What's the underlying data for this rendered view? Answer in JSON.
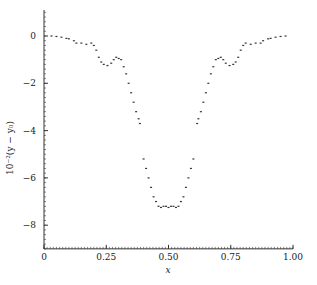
{
  "chart_data": {
    "type": "scatter",
    "title": "",
    "xlabel": "x",
    "ylabel": "10⁻²(y − y₀)",
    "xlim": [
      0,
      1.0
    ],
    "ylim": [
      -9.0,
      1.1
    ],
    "grid": false,
    "legend": null,
    "x_ticks": [
      0,
      0.25,
      0.5,
      0.75,
      1.0
    ],
    "x_tick_labels": [
      "0",
      "0.25",
      "0.50",
      "0.75",
      "1.00"
    ],
    "y_ticks": [
      0,
      -2,
      -4,
      -6,
      -8
    ],
    "y_tick_labels": [
      "0",
      "−2",
      "−4",
      "−6",
      "−8"
    ],
    "series": [
      {
        "name": "data",
        "style": "dotted",
        "x": [
          0.03,
          0.05,
          0.07,
          0.09,
          0.1,
          0.12,
          0.13,
          0.15,
          0.17,
          0.19,
          0.2,
          0.21,
          0.22,
          0.23,
          0.24,
          0.255,
          0.27,
          0.28,
          0.29,
          0.3,
          0.31,
          0.32,
          0.33,
          0.34,
          0.35,
          0.36,
          0.37,
          0.38,
          0.385,
          0.4,
          0.41,
          0.42,
          0.43,
          0.44,
          0.45,
          0.46,
          0.47,
          0.48,
          0.49,
          0.5,
          0.51,
          0.52,
          0.53,
          0.54,
          0.55,
          0.56,
          0.57,
          0.58,
          0.59,
          0.6,
          0.615,
          0.62,
          0.63,
          0.64,
          0.65,
          0.66,
          0.67,
          0.68,
          0.69,
          0.7,
          0.71,
          0.72,
          0.73,
          0.745,
          0.76,
          0.77,
          0.78,
          0.79,
          0.8,
          0.81,
          0.83,
          0.85,
          0.87,
          0.88,
          0.9,
          0.91,
          0.93,
          0.95,
          0.97
        ],
        "y": [
          0.0,
          -0.02,
          -0.05,
          -0.1,
          -0.12,
          -0.2,
          -0.3,
          -0.3,
          -0.35,
          -0.3,
          -0.4,
          -0.6,
          -0.9,
          -1.1,
          -1.2,
          -1.25,
          -1.15,
          -1.0,
          -0.9,
          -0.95,
          -1.0,
          -1.3,
          -1.6,
          -2.0,
          -2.4,
          -2.8,
          -3.2,
          -3.5,
          -3.7,
          -5.2,
          -5.6,
          -6.0,
          -6.4,
          -6.8,
          -7.0,
          -7.2,
          -7.25,
          -7.2,
          -7.2,
          -7.25,
          -7.2,
          -7.2,
          -7.25,
          -7.2,
          -7.0,
          -6.8,
          -6.4,
          -6.0,
          -5.6,
          -5.2,
          -3.7,
          -3.5,
          -3.2,
          -2.8,
          -2.4,
          -2.0,
          -1.6,
          -1.3,
          -1.0,
          -0.95,
          -0.9,
          -1.0,
          -1.15,
          -1.25,
          -1.2,
          -1.1,
          -0.9,
          -0.6,
          -0.4,
          -0.3,
          -0.35,
          -0.3,
          -0.3,
          -0.2,
          -0.12,
          -0.1,
          -0.05,
          -0.02,
          0.0
        ]
      }
    ]
  },
  "colors": {
    "axis": "#333333",
    "marker": "#333333",
    "background": "#ffffff"
  }
}
